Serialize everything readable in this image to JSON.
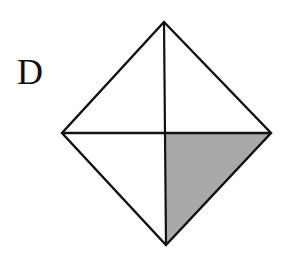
{
  "figure": {
    "label": "D",
    "shape": "square rotated 45° (diamond) divided into four triangles by its diagonals",
    "shaded_region": "bottom-right triangle",
    "colors": {
      "stroke": "#111111",
      "shade": "#a9a9a9",
      "background": "#ffffff"
    },
    "vertices": {
      "top": [
        164,
        22
      ],
      "left": [
        62,
        133
      ],
      "right": [
        271,
        133
      ],
      "bottom": [
        166,
        245
      ],
      "center": [
        165,
        133
      ]
    }
  }
}
